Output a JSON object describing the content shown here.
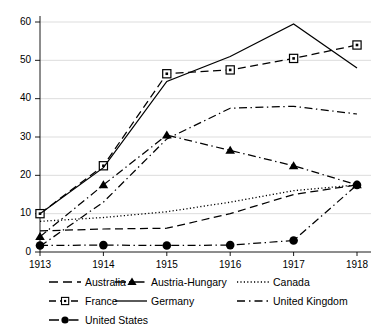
{
  "chart_data": {
    "type": "line",
    "title": "",
    "xlabel": "",
    "ylabel": "",
    "x": [
      1913,
      1914,
      1915,
      1916,
      1917,
      1918
    ],
    "xtick_labels": [
      "1913",
      "1914",
      "1915",
      "1916",
      "1917",
      "1918"
    ],
    "ytick_labels": [
      "0",
      "10",
      "20",
      "30",
      "40",
      "50",
      "60"
    ],
    "yticks": [
      0,
      10,
      20,
      30,
      40,
      50,
      60
    ],
    "xlim": [
      1913,
      1918
    ],
    "ylim": [
      0,
      60
    ],
    "grid": true,
    "legend_position": "below",
    "series": [
      {
        "name": "Australia",
        "values": [
          5.5,
          6.0,
          6.2,
          10.0,
          15.0,
          17.5
        ],
        "linestyle": "dashed",
        "marker": "none",
        "color": "#000000"
      },
      {
        "name": "Austria-Hungary",
        "values": [
          4.0,
          17.5,
          30.5,
          26.5,
          22.5,
          17.5
        ],
        "linestyle": "dashdot",
        "marker": "triangle",
        "color": "#000000"
      },
      {
        "name": "Canada",
        "values": [
          8.0,
          9.0,
          10.5,
          13.0,
          16.0,
          17.5
        ],
        "linestyle": "dotted",
        "marker": "none",
        "color": "#000000"
      },
      {
        "name": "France",
        "values": [
          10.0,
          22.5,
          46.5,
          47.5,
          50.5,
          54.0
        ],
        "linestyle": "dashed",
        "marker": "square",
        "color": "#000000"
      },
      {
        "name": "Germany",
        "values": [
          10.0,
          22.0,
          44.5,
          51.0,
          59.5,
          48.0
        ],
        "linestyle": "solid",
        "marker": "none",
        "color": "#000000"
      },
      {
        "name": "United Kingdom",
        "values": [
          1.5,
          13.0,
          29.5,
          37.5,
          38.0,
          36.0
        ],
        "linestyle": "dashdot",
        "marker": "none",
        "color": "#000000"
      },
      {
        "name": "United States",
        "values": [
          1.7,
          1.8,
          1.7,
          1.8,
          3.0,
          17.5
        ],
        "linestyle": "dashdot",
        "marker": "circle",
        "color": "#000000"
      }
    ]
  },
  "legend": {
    "rows": [
      [
        {
          "label": "Australia",
          "key": "dashed-line"
        },
        {
          "label": "Austria-Hungary",
          "key": "dashdot-triangle-line"
        },
        {
          "label": "Canada",
          "key": "dotted-line"
        }
      ],
      [
        {
          "label": "France",
          "key": "dashed-square-line"
        },
        {
          "label": "Germany",
          "key": "solid-line"
        },
        {
          "label": "United Kingdom",
          "key": "dashdot-line"
        }
      ],
      [
        {
          "label": "United States",
          "key": "dashdot-circle-line"
        }
      ]
    ]
  }
}
